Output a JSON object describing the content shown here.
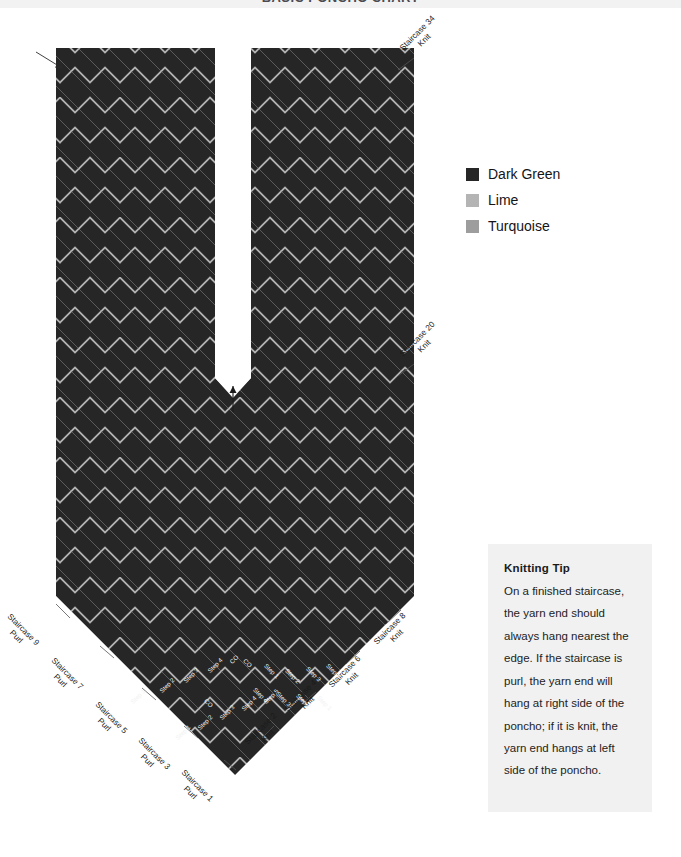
{
  "header": {
    "title": "BASIC PONCHO CHART"
  },
  "legend": {
    "items": [
      {
        "label": "Dark Green",
        "color": "#262626"
      },
      {
        "label": "Lime",
        "color": "#b4b4b4"
      },
      {
        "label": "Turquoise",
        "color": "#9d9d9d"
      }
    ]
  },
  "tip": {
    "title": "Knitting Tip",
    "body": "On a finished staircase, the yarn end should always hang nearest the edge. If the staircase is purl, the yarn end will hang at right side of the poncho; if it is knit, the yarn end hangs at left side of the poncho."
  },
  "callouts": {
    "right": [
      {
        "name": "Staircase 34",
        "type": "Knit",
        "x": 398,
        "y": 46
      },
      {
        "name": "Staircase 20",
        "type": "Knit",
        "x": 398,
        "y": 352
      },
      {
        "name": "Staircase 8",
        "type": "Knit",
        "x": 372,
        "y": 640
      },
      {
        "name": "Staircase 6",
        "type": "Knit",
        "x": 327,
        "y": 683
      },
      {
        "name": "Staircase 4",
        "type": "Knit",
        "x": 283,
        "y": 707
      },
      {
        "name": "Staircase 2",
        "type": "Knit",
        "x": 243,
        "y": 740
      }
    ],
    "left": [
      {
        "name": "Staircase 9",
        "type": "Purl",
        "x": 12,
        "y": 612
      },
      {
        "name": "Staircase 7",
        "type": "Purl",
        "x": 56,
        "y": 656
      },
      {
        "name": "Staircase 5",
        "type": "Purl",
        "x": 100,
        "y": 700
      },
      {
        "name": "Staircase 3",
        "type": "Purl",
        "x": 143,
        "y": 736
      },
      {
        "name": "Staircase 1",
        "type": "Purl",
        "x": 186,
        "y": 768
      }
    ]
  },
  "steps": {
    "cast_on_label": "CO",
    "labels": [
      "Step 1",
      "Step 2",
      "Step 3",
      "Step 4",
      "Step 5"
    ],
    "left_block": [
      {
        "text": "Step 1",
        "x": 129,
        "y": 700
      },
      {
        "text": "Step 2",
        "x": 158,
        "y": 689
      },
      {
        "text": "Step 3",
        "x": 182,
        "y": 679
      },
      {
        "text": "Step 4",
        "x": 206,
        "y": 669
      },
      {
        "text": "CO",
        "x": 228,
        "y": 660
      }
    ],
    "right_block": [
      {
        "text": "CO",
        "x": 247,
        "y": 657
      },
      {
        "text": "Step 1",
        "x": 268,
        "y": 662
      },
      {
        "text": "Step 2",
        "x": 289,
        "y": 667
      },
      {
        "text": "Step 3",
        "x": 310,
        "y": 665
      },
      {
        "text": "Step 4",
        "x": 330,
        "y": 662
      }
    ],
    "row2_left": [
      {
        "text": "Step 1",
        "x": 174,
        "y": 736
      },
      {
        "text": "Step 2",
        "x": 196,
        "y": 726
      },
      {
        "text": "Step 3",
        "x": 218,
        "y": 716
      },
      {
        "text": "Step 4",
        "x": 240,
        "y": 707
      },
      {
        "text": "Step 5",
        "x": 262,
        "y": 700
      }
    ],
    "row2_right": [
      {
        "text": "CO",
        "x": 208,
        "y": 697
      },
      {
        "text": "Step 4",
        "x": 257,
        "y": 686
      },
      {
        "text": "Step 3",
        "x": 280,
        "y": 690
      },
      {
        "text": "Step 2",
        "x": 300,
        "y": 692
      },
      {
        "text": "Step 1",
        "x": 321,
        "y": 694
      }
    ]
  },
  "chart_data": {
    "type": "heatmap",
    "title": "BASIC PONCHO CHART",
    "colors": {
      "dark_green": "#262626",
      "lime": "#b4b4b4",
      "turquoise": "#9d9d9d",
      "background": "#ffffff"
    },
    "block_size_px": 30,
    "body": {
      "x": 56,
      "y": 48,
      "width": 358,
      "height": 588,
      "columns": 12,
      "rows": 20
    },
    "neck_slit": {
      "x": 215,
      "y": 48,
      "width": 36,
      "height": 330
    },
    "staircase_numbers_right_knit": [
      2,
      4,
      6,
      8,
      20,
      34
    ],
    "staircase_numbers_left_purl": [
      1,
      3,
      5,
      7,
      9
    ],
    "steps_per_staircase": 5,
    "legend_entries": [
      "Dark Green",
      "Lime",
      "Turquoise"
    ]
  }
}
